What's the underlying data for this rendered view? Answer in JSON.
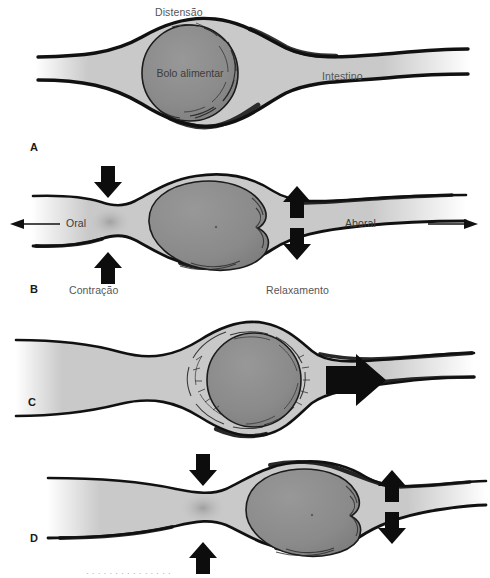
{
  "figure": {
    "language": "pt-BR",
    "background_color": "#ffffff",
    "colors": {
      "lumen_fill": "#c9c9c9",
      "bolus_fill": "#8b8b8b",
      "wall_stroke": "#111111",
      "arrow_fill": "#0d0d0d",
      "label_text": "#555555",
      "panel_letter_text": "#1a1a1a"
    }
  },
  "panels": [
    {
      "letter": "A",
      "name": "distension-stage",
      "labels": {
        "top": "Distensão",
        "bolus": "Bolo alimentar",
        "right": "Intestino"
      },
      "arrows": []
    },
    {
      "letter": "B",
      "name": "contraction-relaxation-stage",
      "labels": {
        "oral": "Oral",
        "aboral": "Aboral",
        "contraction": "Contração",
        "relaxation": "Relaxamento"
      },
      "arrows": [
        {
          "name": "contraction-arrow-down",
          "direction": "down"
        },
        {
          "name": "contraction-arrow-up",
          "direction": "up"
        },
        {
          "name": "relaxation-arrow-up",
          "direction": "up"
        },
        {
          "name": "relaxation-arrow-down",
          "direction": "down"
        },
        {
          "name": "oral-direction-arrow",
          "direction": "left"
        },
        {
          "name": "aboral-direction-arrow",
          "direction": "right"
        }
      ]
    },
    {
      "letter": "C",
      "name": "propulsion-stage",
      "labels": {},
      "arrows": [
        {
          "name": "propulsion-arrow-right",
          "direction": "right"
        }
      ]
    },
    {
      "letter": "D",
      "name": "advancing-contraction-stage",
      "labels": {},
      "arrows": [
        {
          "name": "contraction-arrow-down",
          "direction": "down"
        },
        {
          "name": "contraction-arrow-up",
          "direction": "up"
        },
        {
          "name": "relaxation-arrow-up",
          "direction": "up"
        },
        {
          "name": "relaxation-arrow-down",
          "direction": "down"
        }
      ]
    }
  ],
  "caption_sliver": "  ·  ·   ·    ·   ·    ·     ·   ·   ·    ·     ·  ·   ·    ·   ·"
}
